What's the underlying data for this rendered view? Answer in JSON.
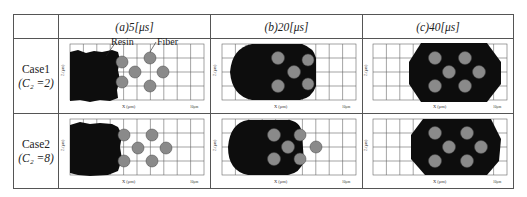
{
  "table": {
    "columns": [
      {
        "label": "(a)5[μs]"
      },
      {
        "label": "(b)20[μs]"
      },
      {
        "label": "(c)40[μs]"
      }
    ],
    "rows": [
      {
        "case": "Case1",
        "param": "(C₂ =2)"
      },
      {
        "case": "Case2",
        "param": "(C₂ =8)"
      }
    ]
  },
  "plot": {
    "xlabel": "X (μm)",
    "ylabel": "Z (μm)",
    "scale_bar": "10μm"
  },
  "annotations": {
    "resin": "Resin",
    "fiber": "Fiber"
  },
  "colors": {
    "resin": "#0d0d0d",
    "fiber": "#8a8a8a",
    "grid": "#666666",
    "border": "#555555"
  }
}
